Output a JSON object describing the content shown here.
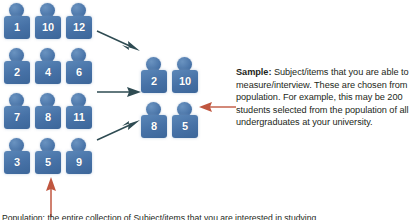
{
  "figure": {
    "background_color": "#ffffff",
    "icon_color": "#4671a6",
    "icon_label_color": "#ffffff",
    "flow_arrow_color": "#2e4b52",
    "highlight_arrow_color": "#c0563f"
  },
  "population": {
    "name": "population-group",
    "rows": [
      {
        "items": [
          "1",
          "10",
          "12"
        ]
      },
      {
        "items": [
          "2",
          "4",
          "6"
        ]
      },
      {
        "items": [
          "7",
          "8",
          "11"
        ]
      },
      {
        "items": [
          "3",
          "5",
          "9"
        ]
      }
    ]
  },
  "sample": {
    "name": "sample-group",
    "rows": [
      {
        "items": [
          "2",
          "10"
        ]
      },
      {
        "items": [
          "8",
          "5"
        ]
      }
    ]
  },
  "arrows": {
    "flow_down_right": "flow-arrow-down-right",
    "flow_right": "flow-arrow-right",
    "flow_up_right": "flow-arrow-up-right",
    "population_pointer": "population-callout-arrow-up",
    "sample_pointer": "sample-callout-arrow-left"
  },
  "callouts": {
    "sample": {
      "term": "Sample:",
      "text": " Subject/items that you are able to measure/interview. These are chosen from population. For example, this may be 200 students selected from the population of all undergraduates at your university."
    },
    "population_caption": "Population: the entire collection of Subject/items that you are interested in studying."
  }
}
